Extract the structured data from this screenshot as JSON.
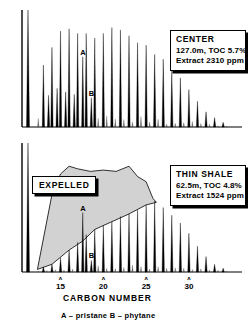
{
  "figure": {
    "background": "#ffffff",
    "ink": "#000000",
    "shade_color": "#d2d2d2"
  },
  "panels": {
    "top": {
      "callout": {
        "title": "CENTER",
        "line2": "127.0m, TOC 5.7%",
        "line3": "Extract  2310 ppm"
      },
      "markers": [
        {
          "label": "A",
          "carbon": 17.6,
          "note": "pristane"
        },
        {
          "label": "B",
          "carbon": 18.6,
          "note": "phytane"
        }
      ]
    },
    "bottom": {
      "callout": {
        "title": "THIN  SHALE",
        "line2": "62.5m, TOC 4.8%",
        "line3": "Extract  1524 ppm"
      },
      "expelled_label": "EXPELLED",
      "markers": [
        {
          "label": "A",
          "carbon": 17.6,
          "note": "pristane"
        },
        {
          "label": "B",
          "carbon": 18.6,
          "note": "phytane"
        }
      ]
    }
  },
  "axis": {
    "title": "CARBON  NUMBER",
    "ticks": [
      {
        "value": 15,
        "label": "15",
        "caret": "ʌ"
      },
      {
        "value": 20,
        "label": "20",
        "caret": "ʌ"
      },
      {
        "value": 25,
        "label": "25",
        "caret": "ʌ"
      },
      {
        "value": 30,
        "label": "30",
        "caret": "ʌ"
      }
    ]
  },
  "footnote": {
    "text": "A – pristane        B – phytane",
    "a_key": "A – pristane",
    "b_key": "B – phytane"
  },
  "chart_data": {
    "type": "line",
    "xlabel": "CARBON NUMBER",
    "ylabel": "",
    "xlim": [
      10.5,
      35.5
    ],
    "xticks": [
      15,
      20,
      25,
      30
    ],
    "grid": false,
    "legend": "none",
    "annotations": [
      "A = pristane",
      "B = phytane",
      "EXPELLED (shaded area, lower panel)"
    ],
    "series": [
      {
        "name": "CENTER",
        "depth_m": 127.0,
        "toc_percent": 5.7,
        "extract_ppm": 2310,
        "ylim": [
          0,
          100
        ],
        "peaks": [
          {
            "carbon": 11.2,
            "height": 100.0,
            "label": "solvent"
          },
          {
            "carbon": 13.0,
            "height": 53.0
          },
          {
            "carbon": 13.6,
            "height": 27.0
          },
          {
            "carbon": 14.0,
            "height": 68.0
          },
          {
            "carbon": 14.6,
            "height": 33.0
          },
          {
            "carbon": 15.0,
            "height": 82.0
          },
          {
            "carbon": 15.6,
            "height": 30.0
          },
          {
            "carbon": 16.0,
            "height": 84.0
          },
          {
            "carbon": 16.6,
            "height": 28.0
          },
          {
            "carbon": 17.0,
            "height": 80.0
          },
          {
            "carbon": 17.6,
            "height": 60.0,
            "label": "A"
          },
          {
            "carbon": 18.0,
            "height": 80.0
          },
          {
            "carbon": 18.6,
            "height": 25.0,
            "label": "B"
          },
          {
            "carbon": 19.0,
            "height": 76.0
          },
          {
            "carbon": 20.0,
            "height": 80.0
          },
          {
            "carbon": 21.0,
            "height": 85.0
          },
          {
            "carbon": 22.0,
            "height": 83.0
          },
          {
            "carbon": 23.0,
            "height": 78.0
          },
          {
            "carbon": 24.0,
            "height": 72.0
          },
          {
            "carbon": 25.0,
            "height": 70.0
          },
          {
            "carbon": 26.0,
            "height": 62.0
          },
          {
            "carbon": 27.0,
            "height": 58.0
          },
          {
            "carbon": 28.0,
            "height": 48.0
          },
          {
            "carbon": 29.0,
            "height": 42.0
          },
          {
            "carbon": 30.0,
            "height": 32.0
          },
          {
            "carbon": 31.0,
            "height": 22.0
          },
          {
            "carbon": 32.0,
            "height": 13.0
          },
          {
            "carbon": 33.0,
            "height": 8.0
          },
          {
            "carbon": 34.0,
            "height": 4.0
          }
        ]
      },
      {
        "name": "THIN SHALE",
        "depth_m": 62.5,
        "toc_percent": 4.8,
        "extract_ppm": 1524,
        "ylim": [
          0,
          100
        ],
        "peaks": [
          {
            "carbon": 11.2,
            "height": 100.0,
            "label": "solvent"
          },
          {
            "carbon": 13.0,
            "height": 4.0
          },
          {
            "carbon": 14.0,
            "height": 6.0
          },
          {
            "carbon": 15.0,
            "height": 11.0
          },
          {
            "carbon": 16.0,
            "height": 17.0
          },
          {
            "carbon": 17.0,
            "height": 23.0
          },
          {
            "carbon": 17.6,
            "height": 46.0,
            "label": "A"
          },
          {
            "carbon": 18.0,
            "height": 29.0
          },
          {
            "carbon": 18.6,
            "height": 9.0,
            "label": "B"
          },
          {
            "carbon": 19.0,
            "height": 33.0
          },
          {
            "carbon": 20.0,
            "height": 36.0
          },
          {
            "carbon": 21.0,
            "height": 39.0
          },
          {
            "carbon": 22.0,
            "height": 43.0
          },
          {
            "carbon": 23.0,
            "height": 45.0
          },
          {
            "carbon": 24.0,
            "height": 48.0
          },
          {
            "carbon": 25.0,
            "height": 52.0
          },
          {
            "carbon": 26.0,
            "height": 55.0
          },
          {
            "carbon": 27.0,
            "height": 50.0
          },
          {
            "carbon": 28.0,
            "height": 44.0
          },
          {
            "carbon": 29.0,
            "height": 38.0
          },
          {
            "carbon": 30.0,
            "height": 30.0
          },
          {
            "carbon": 31.0,
            "height": 20.0
          },
          {
            "carbon": 32.0,
            "height": 12.0
          },
          {
            "carbon": 33.0,
            "height": 6.0
          },
          {
            "carbon": 34.0,
            "height": 3.0
          }
        ],
        "expelled_envelope_top": [
          {
            "carbon": 12.3,
            "height": 2.0
          },
          {
            "carbon": 14.0,
            "height": 60.0
          },
          {
            "carbon": 15.0,
            "height": 76.0
          },
          {
            "carbon": 16.0,
            "height": 82.0
          },
          {
            "carbon": 17.0,
            "height": 80.0
          },
          {
            "carbon": 18.5,
            "height": 78.0
          },
          {
            "carbon": 20.0,
            "height": 79.0
          },
          {
            "carbon": 21.5,
            "height": 78.0
          },
          {
            "carbon": 23.0,
            "height": 82.0
          },
          {
            "carbon": 24.0,
            "height": 74.0
          },
          {
            "carbon": 25.0,
            "height": 70.0
          },
          {
            "carbon": 25.8,
            "height": 57.0
          },
          {
            "carbon": 26.2,
            "height": 54.0
          }
        ],
        "expelled_envelope_bottom": [
          {
            "carbon": 26.2,
            "height": 54.0
          },
          {
            "carbon": 25.0,
            "height": 52.0
          },
          {
            "carbon": 23.0,
            "height": 45.0
          },
          {
            "carbon": 21.0,
            "height": 39.0
          },
          {
            "carbon": 19.0,
            "height": 33.0
          },
          {
            "carbon": 17.6,
            "height": 24.0
          },
          {
            "carbon": 16.0,
            "height": 17.0
          },
          {
            "carbon": 14.0,
            "height": 6.0
          },
          {
            "carbon": 12.3,
            "height": 2.0
          }
        ]
      }
    ]
  }
}
